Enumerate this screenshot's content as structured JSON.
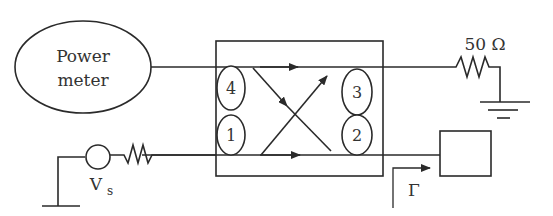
{
  "diagram": {
    "power_meter": {
      "line1": "Power",
      "line2": "meter"
    },
    "coupler": {
      "ports": [
        {
          "id": "1",
          "label": "1"
        },
        {
          "id": "2",
          "label": "2"
        },
        {
          "id": "3",
          "label": "3"
        },
        {
          "id": "4",
          "label": "4"
        }
      ]
    },
    "termination": {
      "label": "50 Ω"
    },
    "source": {
      "label": "V",
      "subscript": "s"
    },
    "reflection": {
      "label": "Γ"
    },
    "load": {
      "label": ""
    },
    "colors": {
      "stroke": "#2a2a2a",
      "background": "#ffffff"
    }
  }
}
